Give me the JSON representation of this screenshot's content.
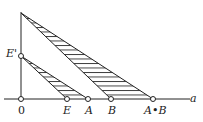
{
  "labels": {
    "origin": "0",
    "e_prime": "E'",
    "e": "E",
    "a": "A",
    "b": "B",
    "ab": "A•B",
    "axis": "a"
  },
  "colors": {
    "line": "#222222",
    "background": "#ffffff"
  }
}
